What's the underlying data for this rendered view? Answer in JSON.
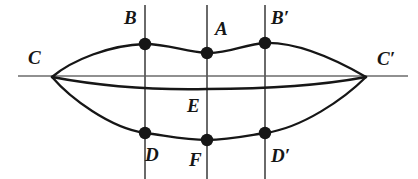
{
  "figure": {
    "kind": "geometry-diagram",
    "width": 418,
    "height": 179,
    "background_color": "#ffffff",
    "stroke_color": "#161616",
    "axis_color": "#6b6b6b",
    "vertical_line_color": "#5a5a5a"
  },
  "labels": {
    "C": "C",
    "C_prime": "C′",
    "B": "B",
    "A": "A",
    "B_prime": "B′",
    "D": "D",
    "F": "F",
    "D_prime": "D′",
    "E": "E"
  },
  "label_positions": [
    {
      "key": "C",
      "name": "label-C",
      "text": "C",
      "x": 28,
      "y": 48
    },
    {
      "key": "B",
      "name": "label-B",
      "text": "B",
      "x": 124,
      "y": 8
    },
    {
      "key": "A",
      "name": "label-A",
      "text": "A",
      "x": 215,
      "y": 19
    },
    {
      "key": "B_prime",
      "name": "label-B-prime",
      "text": "B′",
      "x": 271,
      "y": 8
    },
    {
      "key": "C_prime",
      "name": "label-C-prime",
      "text": "C′",
      "x": 377,
      "y": 49
    },
    {
      "key": "E",
      "name": "label-E",
      "text": "E",
      "x": 187,
      "y": 96
    },
    {
      "key": "D",
      "name": "label-D",
      "text": "D",
      "x": 145,
      "y": 145
    },
    {
      "key": "F",
      "name": "label-F",
      "text": "F",
      "x": 189,
      "y": 150
    },
    {
      "key": "D_prime",
      "name": "label-D-prime",
      "text": "D′",
      "x": 271,
      "y": 146
    }
  ],
  "points": [
    {
      "key": "B",
      "name": "vertex-dot-B",
      "x": 145,
      "y": 44,
      "r": 6.2,
      "marked": true
    },
    {
      "key": "A",
      "name": "vertex-dot-A",
      "x": 207,
      "y": 53,
      "r": 6.2,
      "marked": true
    },
    {
      "key": "B_prime",
      "name": "vertex-dot-B-prime",
      "x": 265,
      "y": 43,
      "r": 6.2,
      "marked": true
    },
    {
      "key": "D",
      "name": "vertex-dot-D",
      "x": 145,
      "y": 133,
      "r": 6.2,
      "marked": true
    },
    {
      "key": "F",
      "name": "vertex-dot-F",
      "x": 207,
      "y": 140,
      "r": 6.2,
      "marked": true
    },
    {
      "key": "D_prime",
      "name": "vertex-dot-D-prime",
      "x": 265,
      "y": 133,
      "r": 6.2,
      "marked": true
    },
    {
      "key": "C",
      "name": "vertex-C",
      "x": 52,
      "y": 77,
      "r": 0,
      "marked": false
    },
    {
      "key": "C_prime",
      "name": "vertex-C-prime",
      "x": 366,
      "y": 77,
      "r": 0,
      "marked": false
    }
  ],
  "axis": {
    "name": "horizontal-axis-line",
    "x1": 18,
    "y1": 76,
    "x2": 408,
    "y2": 76,
    "width": 1.6
  },
  "vertical_lines": [
    {
      "name": "vertical-line-through-B-D",
      "x": 145,
      "y1": 5,
      "y2": 179,
      "width": 1.8
    },
    {
      "name": "vertical-line-through-A-E-F",
      "x": 207,
      "y1": 5,
      "y2": 179,
      "width": 1.8
    },
    {
      "name": "vertical-line-through-B-prime-D-prime",
      "x": 265,
      "y1": 5,
      "y2": 179,
      "width": 1.8
    }
  ],
  "curves": [
    {
      "name": "upper-arc-C-B-A-B-prime-C-prime",
      "description": "Upper boundary arc from C rising through B, dipping at A, rising to B prime, descending to C prime",
      "path": "M 52 77 C 72 60, 110 45, 145 44 C 168 44, 186 52, 207 53 C 228 54, 245 44, 265 43 C 300 42, 340 62, 366 77",
      "width": 2.3
    },
    {
      "name": "lower-arc-C-D-F-D-prime-C-prime",
      "description": "Lower boundary arc from C descending through D, F, D prime, rising to C prime",
      "path": "M 52 77 C 70 98, 110 128, 145 133 C 168 136, 186 140, 207 140 C 228 140, 246 136, 265 133 C 302 128, 344 99, 366 77",
      "width": 2.3
    },
    {
      "name": "median-chord-curve-through-E",
      "description": "Slightly sagging heavy chord from C to C prime passing just below E label level",
      "path": "M 52 77 C 110 88, 160 90, 207 89 C 260 89, 318 86, 366 77",
      "width": 2.6
    }
  ]
}
